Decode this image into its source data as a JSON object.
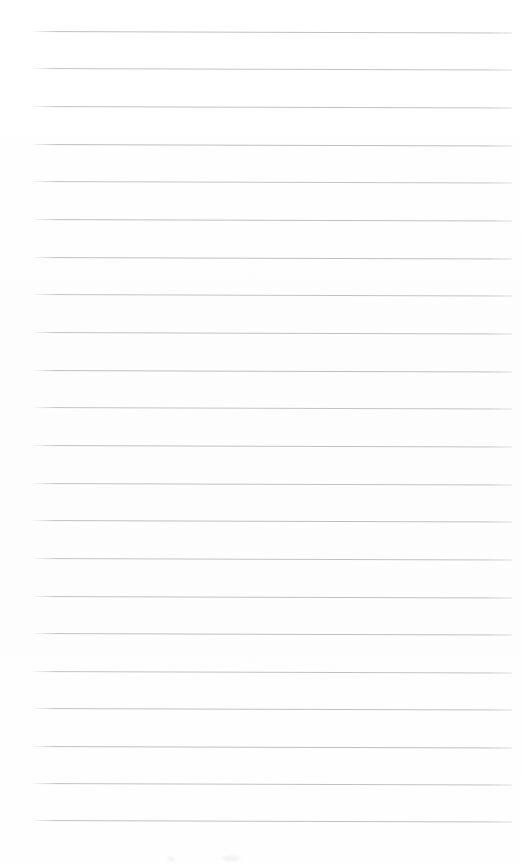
{
  "document": {
    "type": "ruled-notebook-page",
    "title": "Blank ruled notebook page",
    "description": "Scanned blank lined paper with horizontal ruled lines and no written content",
    "page_width": 521,
    "page_height": 865,
    "background_color": "#fefefe",
    "has_text_content": false,
    "written_text": "",
    "caption": "Blank lined notebook page"
  },
  "ruling": {
    "line_color": "#b9bcbf",
    "line_thickness_px": 1,
    "line_count": 22,
    "first_line_y": 31,
    "line_spacing_px": 37.6,
    "left_margin_x": 31,
    "right_margin_x": 512,
    "line_length_px": 481,
    "tilt_degrees": 0.18,
    "margin_rule": "none",
    "lines": [
      {
        "index": 1,
        "y": 31,
        "opacity": 0.92
      },
      {
        "index": 2,
        "y": 68,
        "opacity": 0.88
      },
      {
        "index": 3,
        "y": 106,
        "opacity": 0.9
      },
      {
        "index": 4,
        "y": 144,
        "opacity": 0.95
      },
      {
        "index": 5,
        "y": 181,
        "opacity": 0.85
      },
      {
        "index": 6,
        "y": 219,
        "opacity": 0.9
      },
      {
        "index": 7,
        "y": 257,
        "opacity": 0.93
      },
      {
        "index": 8,
        "y": 294,
        "opacity": 0.87
      },
      {
        "index": 9,
        "y": 332,
        "opacity": 0.9
      },
      {
        "index": 10,
        "y": 370,
        "opacity": 0.94
      },
      {
        "index": 11,
        "y": 407,
        "opacity": 0.86
      },
      {
        "index": 12,
        "y": 445,
        "opacity": 0.91
      },
      {
        "index": 13,
        "y": 483,
        "opacity": 0.89
      },
      {
        "index": 14,
        "y": 520,
        "opacity": 0.93
      },
      {
        "index": 15,
        "y": 558,
        "opacity": 0.88
      },
      {
        "index": 16,
        "y": 596,
        "opacity": 0.9
      },
      {
        "index": 17,
        "y": 633,
        "opacity": 0.92
      },
      {
        "index": 18,
        "y": 671,
        "opacity": 0.87
      },
      {
        "index": 19,
        "y": 708,
        "opacity": 0.9
      },
      {
        "index": 20,
        "y": 746,
        "opacity": 0.94
      },
      {
        "index": 21,
        "y": 783,
        "opacity": 0.89
      },
      {
        "index": 22,
        "y": 820,
        "opacity": 0.91
      }
    ]
  },
  "artifacts": {
    "smudges": [
      {
        "name": "scan-smudge-left",
        "x": 168,
        "y": 857,
        "width": 7,
        "height": 4
      },
      {
        "name": "scan-smudge-right",
        "x": 222,
        "y": 856,
        "width": 18,
        "height": 5
      }
    ]
  }
}
